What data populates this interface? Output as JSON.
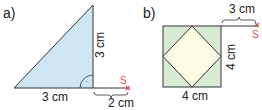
{
  "figure_a": {
    "label": "a)",
    "shape": "right triangle",
    "base_label": "3 cm",
    "height_label": "3 cm",
    "extension_label": "2 cm",
    "point_label": "S",
    "fill_color": "#cfe6f5",
    "right_angle_marker": "·"
  },
  "figure_b": {
    "label": "b)",
    "shape": "square with inscribed square (rotated 45°)",
    "bottom_label": "4 cm",
    "side_label": "4 cm",
    "extension_label": "3 cm",
    "point_label": "S",
    "outer_fill_color": "#d8ead2",
    "inner_fill_color": "#fbfbe3"
  },
  "colors": {
    "stroke": "#333333",
    "point_marker": "#d9534f"
  }
}
